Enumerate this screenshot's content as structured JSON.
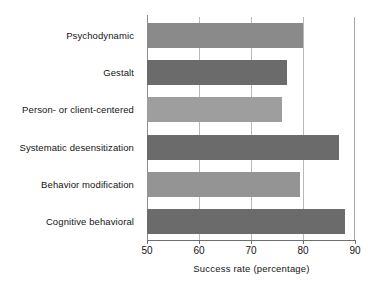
{
  "chart_data": {
    "type": "bar",
    "orientation": "horizontal",
    "title": "",
    "xlabel": "Success rate (percentage)",
    "ylabel": "",
    "xlim": [
      50,
      90
    ],
    "xticks": [
      50,
      60,
      70,
      80,
      90
    ],
    "grid": true,
    "legend": false,
    "categories": [
      "Psychodynamic",
      "Gestalt",
      "Person- or client-centered",
      "Systematic desensitization",
      "Behavior modification",
      "Cognitive behavioral"
    ],
    "values": [
      80,
      77,
      76,
      87,
      79.5,
      88
    ],
    "bar_colors": [
      "#8a8a8a",
      "#6b6b6b",
      "#9e9e9e",
      "#6b6b6b",
      "#949494",
      "#6b6b6b"
    ]
  },
  "axis": {
    "x_title": "Success rate (percentage)",
    "tick_labels": [
      "50",
      "60",
      "70",
      "80",
      "90"
    ]
  },
  "colors": {
    "background": "#ffffff",
    "text": "#141414",
    "gridline": "#b9b9b9",
    "axis": "#6e6e6e"
  }
}
